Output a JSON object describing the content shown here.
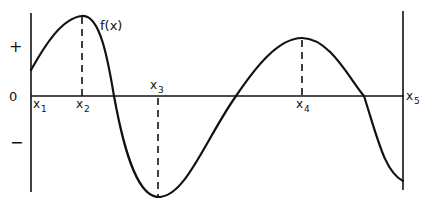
{
  "diagram": {
    "function_label": "f(x)",
    "sign_labels": {
      "positive": "+",
      "zero": "0",
      "negative": "−"
    },
    "x_points": [
      {
        "name": "x1",
        "base": "x",
        "sub": "1",
        "feature": "left boundary (start of interval)"
      },
      {
        "name": "x2",
        "base": "x",
        "sub": "2",
        "feature": "local maximum"
      },
      {
        "name": "x3",
        "base": "x",
        "sub": "3",
        "feature": "local minimum"
      },
      {
        "name": "x4",
        "base": "x",
        "sub": "4",
        "feature": "local maximum"
      },
      {
        "name": "x5",
        "base": "x",
        "sub": "5",
        "feature": "right boundary (end of interval)"
      }
    ],
    "colors": {
      "ink": "#111111",
      "background": "#ffffff"
    }
  }
}
